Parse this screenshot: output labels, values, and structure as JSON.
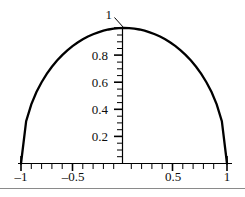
{
  "figure": {
    "background": "#ffffff",
    "curve_color": "#000000",
    "axis_color": "#000000",
    "rule_color": "#8a8a8a",
    "bottom_rule": true
  },
  "chart_data": {
    "type": "line",
    "title": "",
    "subtitle": "",
    "xlabel": "",
    "ylabel": "",
    "function": "y = sqrt(1 - x^2)",
    "xlim": [
      -1,
      1
    ],
    "ylim": [
      0,
      1
    ],
    "grid": false,
    "legend": null,
    "x_ticks_major": [
      -1,
      -0.5,
      0.5,
      1
    ],
    "x_tick_labels": [
      "–1",
      "–0.5",
      "0.5",
      "1"
    ],
    "x_ticks_minor_step": 0.1,
    "y_ticks_major": [
      0.2,
      0.4,
      0.6,
      0.8,
      1
    ],
    "y_tick_labels": [
      "0.2",
      "0.4",
      "0.6",
      "0.8",
      "1"
    ],
    "y_ticks_minor_step": 0.05,
    "annotations": [
      {
        "text": "1",
        "x": 0,
        "y": 1,
        "kind": "leader-callout",
        "note": "Label '1' sits above-left of the curve apex with a short diagonal leader line pointing to the y-axis top tick."
      }
    ],
    "x": [
      -1,
      -0.95,
      -0.9,
      -0.85,
      -0.8,
      -0.75,
      -0.7,
      -0.65,
      -0.6,
      -0.55,
      -0.5,
      -0.45,
      -0.4,
      -0.35,
      -0.3,
      -0.25,
      -0.2,
      -0.15,
      -0.1,
      -0.05,
      0,
      0.05,
      0.1,
      0.15,
      0.2,
      0.25,
      0.3,
      0.35,
      0.4,
      0.45,
      0.5,
      0.55,
      0.6,
      0.65,
      0.7,
      0.75,
      0.8,
      0.85,
      0.9,
      0.95,
      1
    ],
    "y": [
      0,
      0.312,
      0.436,
      0.527,
      0.6,
      0.661,
      0.714,
      0.76,
      0.8,
      0.835,
      0.866,
      0.893,
      0.917,
      0.937,
      0.954,
      0.968,
      0.98,
      0.989,
      0.995,
      0.999,
      1,
      0.999,
      0.995,
      0.989,
      0.98,
      0.968,
      0.954,
      0.937,
      0.917,
      0.893,
      0.866,
      0.835,
      0.8,
      0.76,
      0.714,
      0.661,
      0.6,
      0.527,
      0.436,
      0.312,
      0
    ]
  },
  "labels": {
    "y": {
      "t02": "0.2",
      "t04": "0.4",
      "t06": "0.6",
      "t08": "0.8",
      "t10": "1"
    },
    "x": {
      "neg1": "–1",
      "neghalf": "–0.5",
      "half": "0.5",
      "one": "1"
    }
  }
}
